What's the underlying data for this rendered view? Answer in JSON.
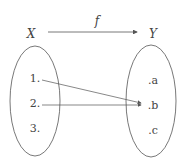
{
  "diagram": {
    "function_label": "f",
    "domain_label": "X",
    "codomain_label": "Y",
    "domain_elements": [
      "1.",
      "2.",
      "3."
    ],
    "codomain_elements": [
      ".a",
      ".b",
      ".c"
    ],
    "mappings": [
      {
        "from": "1.",
        "to": ".b"
      },
      {
        "from": "2.",
        "to": ".b"
      }
    ],
    "colors": {
      "stroke": "#555555",
      "text": "#444444"
    }
  }
}
